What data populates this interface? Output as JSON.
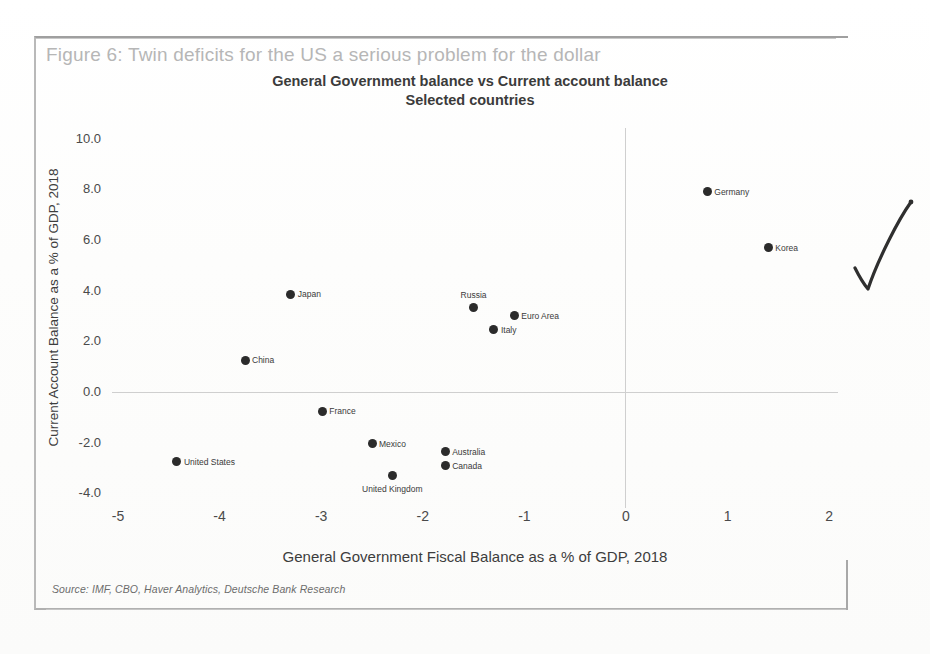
{
  "figure": {
    "caption": "Figure 6: Twin deficits for the US a serious problem for the dollar",
    "source_note": "Source: IMF, CBO, Haver Analytics, Deutsche Bank Research",
    "annotation": "handwritten-check-mark"
  },
  "chart_data": {
    "type": "scatter",
    "title": "General Government balance vs Current account balance",
    "subtitle": "Selected countries",
    "xlabel": "General Government Fiscal Balance as a % of GDP, 2018",
    "ylabel": "Current Account Balance as a % of GDP, 2018",
    "xlim": [
      -5,
      2
    ],
    "ylim": [
      -4.0,
      10.0
    ],
    "xticks": [
      "-5",
      "-4",
      "-3",
      "-2",
      "-1",
      "0",
      "1",
      "2"
    ],
    "yticks": [
      "10.0",
      "8.0",
      "6.0",
      "4.0",
      "2.0",
      "0.0",
      "-2.0",
      "-4.0"
    ],
    "grid": false,
    "legend": "none",
    "zero_lines": true,
    "marker_color": "#2b2b2b",
    "points": [
      {
        "label": "Germany",
        "x": 0.8,
        "y": 7.9,
        "label_pos": "right"
      },
      {
        "label": "Korea",
        "x": 1.4,
        "y": 5.7,
        "label_pos": "right"
      },
      {
        "label": "Japan",
        "x": -3.3,
        "y": 3.85,
        "label_pos": "right"
      },
      {
        "label": "Russia",
        "x": -1.5,
        "y": 3.35,
        "label_pos": "above"
      },
      {
        "label": "Euro Area",
        "x": -1.1,
        "y": 3.0,
        "label_pos": "right"
      },
      {
        "label": "Italy",
        "x": -1.3,
        "y": 2.45,
        "label_pos": "right"
      },
      {
        "label": "China",
        "x": -3.75,
        "y": 1.25,
        "label_pos": "right"
      },
      {
        "label": "France",
        "x": -2.99,
        "y": -0.75,
        "label_pos": "right"
      },
      {
        "label": "Mexico",
        "x": -2.5,
        "y": -2.05,
        "label_pos": "right"
      },
      {
        "label": "Australia",
        "x": -1.78,
        "y": -2.35,
        "label_pos": "right"
      },
      {
        "label": "Canada",
        "x": -1.78,
        "y": -2.9,
        "label_pos": "right"
      },
      {
        "label": "United States",
        "x": -4.42,
        "y": -2.75,
        "label_pos": "right"
      },
      {
        "label": "United Kingdom",
        "x": -2.3,
        "y": -3.3,
        "label_pos": "below"
      }
    ]
  }
}
